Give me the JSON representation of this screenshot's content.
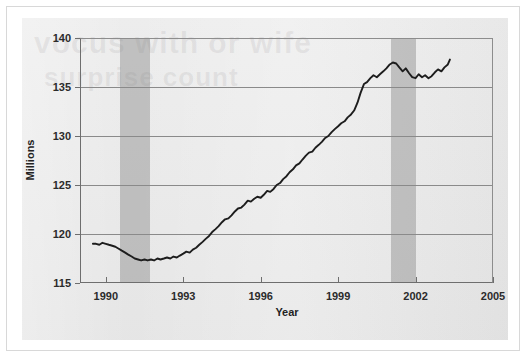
{
  "figure": {
    "panel_bg": "#e9e9e9",
    "line_color": "#1d1d1d",
    "band_color": "#848484",
    "grid_color": "#8a8a8a",
    "ghost_text_1": "vocus with or wife",
    "ghost_text_2": "surprise count"
  },
  "chart_data": {
    "type": "line",
    "title": "",
    "subtitle": "",
    "xlabel": "Year",
    "ylabel": "Millions",
    "xlim": [
      1989,
      2005
    ],
    "ylim": [
      115,
      140
    ],
    "x_ticks": [
      1990,
      1993,
      1996,
      1999,
      2002,
      2005
    ],
    "x_tick_labels": [
      "1990",
      "1993",
      "1996",
      "1999",
      "2002",
      "2005"
    ],
    "y_ticks": [
      115,
      120,
      125,
      130,
      135,
      140
    ],
    "y_tick_labels": [
      "115",
      "120",
      "125",
      "130",
      "135",
      "140"
    ],
    "grid": "horizontal",
    "legend": "none",
    "shaded_regions": [
      {
        "label": "recession",
        "x_start": 1990.55,
        "x_end": 1991.7
      },
      {
        "label": "recession",
        "x_start": 2001.05,
        "x_end": 2002.0
      }
    ],
    "series": [
      {
        "name": "Employment",
        "color": "#1d1d1d",
        "x": [
          1989.5,
          1989.62,
          1989.75,
          1989.87,
          1990.0,
          1990.12,
          1990.25,
          1990.37,
          1990.5,
          1990.62,
          1990.75,
          1990.87,
          1991.0,
          1991.12,
          1991.25,
          1991.37,
          1991.5,
          1991.62,
          1991.75,
          1991.87,
          1992.0,
          1992.12,
          1992.25,
          1992.37,
          1992.5,
          1992.62,
          1992.75,
          1992.87,
          1993.0,
          1993.12,
          1993.25,
          1993.37,
          1993.5,
          1993.62,
          1993.75,
          1993.87,
          1994.0,
          1994.12,
          1994.25,
          1994.37,
          1994.5,
          1994.62,
          1994.75,
          1994.87,
          1995.0,
          1995.12,
          1995.25,
          1995.37,
          1995.5,
          1995.62,
          1995.75,
          1995.87,
          1996.0,
          1996.12,
          1996.25,
          1996.37,
          1996.5,
          1996.62,
          1996.75,
          1996.87,
          1997.0,
          1997.12,
          1997.25,
          1997.37,
          1997.5,
          1997.62,
          1997.75,
          1997.87,
          1998.0,
          1998.12,
          1998.25,
          1998.37,
          1998.5,
          1998.62,
          1998.75,
          1998.87,
          1999.0,
          1999.12,
          1999.25,
          1999.37,
          1999.5,
          1999.62,
          1999.75,
          1999.87,
          2000.0,
          2000.12,
          2000.25,
          2000.37,
          2000.5,
          2000.62,
          2000.75,
          2000.87,
          2001.0,
          2001.12,
          2001.25,
          2001.37,
          2001.5,
          2001.62,
          2001.75,
          2001.87,
          2002.0,
          2002.12,
          2002.25,
          2002.37,
          2002.5,
          2002.62,
          2002.75,
          2002.87,
          2003.0,
          2003.12,
          2003.25,
          2003.33
        ],
        "y": [
          119.0,
          119.0,
          118.9,
          119.1,
          119.0,
          118.9,
          118.8,
          118.7,
          118.5,
          118.3,
          118.1,
          117.9,
          117.7,
          117.5,
          117.4,
          117.3,
          117.4,
          117.3,
          117.4,
          117.3,
          117.5,
          117.4,
          117.5,
          117.6,
          117.5,
          117.7,
          117.6,
          117.8,
          118.0,
          118.2,
          118.1,
          118.4,
          118.6,
          118.9,
          119.2,
          119.5,
          119.8,
          120.2,
          120.5,
          120.8,
          121.2,
          121.5,
          121.6,
          121.9,
          122.3,
          122.6,
          122.7,
          123.0,
          123.4,
          123.3,
          123.6,
          123.8,
          123.7,
          124.0,
          124.4,
          124.3,
          124.6,
          125.0,
          125.2,
          125.6,
          125.9,
          126.3,
          126.6,
          127.0,
          127.2,
          127.6,
          128.0,
          128.3,
          128.4,
          128.8,
          129.1,
          129.4,
          129.8,
          130.0,
          130.4,
          130.7,
          131.0,
          131.3,
          131.5,
          131.9,
          132.2,
          132.6,
          133.4,
          134.4,
          135.3,
          135.5,
          135.9,
          136.2,
          136.0,
          136.3,
          136.6,
          136.9,
          137.3,
          137.5,
          137.4,
          137.0,
          136.6,
          136.9,
          136.4,
          136.0,
          135.9,
          136.3,
          136.0,
          136.2,
          135.9,
          136.1,
          136.5,
          136.8,
          136.6,
          137.0,
          137.3,
          137.8
        ]
      }
    ]
  }
}
